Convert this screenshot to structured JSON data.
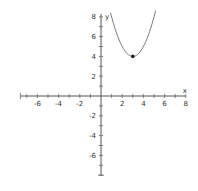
{
  "chart_data": {
    "type": "line",
    "title": "",
    "xlabel": "x",
    "ylabel": "y",
    "xlim": [
      -7.6,
      8
    ],
    "ylim": [
      -8,
      8
    ],
    "x_ticks": [
      -6,
      -4,
      -2,
      2,
      4,
      6,
      8
    ],
    "y_ticks": [
      8,
      6,
      4,
      2,
      -2,
      -4,
      -6
    ],
    "minor_tick_step": 1,
    "grid": false,
    "series": [
      {
        "name": "y = (x - 3)^2 + 4",
        "function": {
          "a": 1,
          "h": 3,
          "k": 4
        },
        "x_range": [
          0.9,
          5.15
        ],
        "color": "#777777"
      }
    ],
    "points": [
      {
        "name": "vertex",
        "x": 3,
        "y": 4
      }
    ]
  }
}
